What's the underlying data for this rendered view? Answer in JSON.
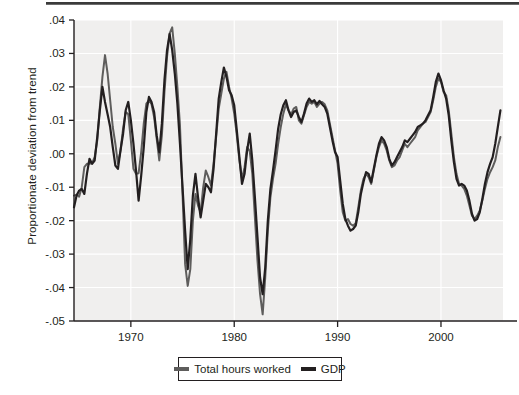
{
  "figure": {
    "background_color": "#ffffff",
    "plot_background_color": "#f0efee",
    "gridline_color": "#ffffff",
    "axis_color": "#231f20"
  },
  "axis_label": {
    "y": "Proportionate deviation from trend",
    "x": ""
  },
  "legend": {
    "position": "below-axis-center",
    "entries": [
      {
        "label": "Total hours worked",
        "color": "#5e5d5c"
      },
      {
        "label": "GDP",
        "color": "#231f20"
      }
    ]
  },
  "chart_data": {
    "type": "line",
    "title": "",
    "subtitle": "",
    "xlabel": "",
    "ylabel": "Proportionate deviation from trend",
    "xlim": [
      1964.5,
      2006.0
    ],
    "ylim": [
      -0.05,
      0.04
    ],
    "xticks": [
      1970,
      1980,
      1990,
      2000
    ],
    "xticklabels": [
      "1970",
      "1980",
      "1990",
      "2000"
    ],
    "yticks": [
      -0.05,
      -0.04,
      -0.03,
      -0.02,
      -0.01,
      0.0,
      0.01,
      0.02,
      0.03,
      0.04
    ],
    "yticklabels": [
      "-.05",
      "-.04",
      "-.03",
      "-.02",
      "-.01",
      ".00",
      ".01",
      ".02",
      ".03",
      ".04"
    ],
    "grid": true,
    "grid_axis": "both",
    "legend_position": "below",
    "x": [
      1964.5,
      1964.75,
      1965.0,
      1965.25,
      1965.5,
      1965.75,
      1966.0,
      1966.25,
      1966.5,
      1966.75,
      1967.0,
      1967.25,
      1967.5,
      1967.75,
      1968.0,
      1968.25,
      1968.5,
      1968.75,
      1969.0,
      1969.25,
      1969.5,
      1969.75,
      1970.0,
      1970.25,
      1970.5,
      1970.75,
      1971.0,
      1971.25,
      1971.5,
      1971.75,
      1972.0,
      1972.25,
      1972.5,
      1972.75,
      1973.0,
      1973.25,
      1973.5,
      1973.75,
      1974.0,
      1974.25,
      1974.5,
      1974.75,
      1975.0,
      1975.25,
      1975.5,
      1975.75,
      1976.0,
      1976.25,
      1976.5,
      1976.75,
      1977.0,
      1977.25,
      1977.5,
      1977.75,
      1978.0,
      1978.25,
      1978.5,
      1978.75,
      1979.0,
      1979.25,
      1979.5,
      1979.75,
      1980.0,
      1980.25,
      1980.5,
      1980.75,
      1981.0,
      1981.25,
      1981.5,
      1981.75,
      1982.0,
      1982.25,
      1982.5,
      1982.75,
      1983.0,
      1983.25,
      1983.5,
      1983.75,
      1984.0,
      1984.25,
      1984.5,
      1984.75,
      1985.0,
      1985.25,
      1985.5,
      1985.75,
      1986.0,
      1986.25,
      1986.5,
      1986.75,
      1987.0,
      1987.25,
      1987.5,
      1987.75,
      1988.0,
      1988.25,
      1988.5,
      1988.75,
      1989.0,
      1989.25,
      1989.5,
      1989.75,
      1990.0,
      1990.25,
      1990.5,
      1990.75,
      1991.0,
      1991.25,
      1991.5,
      1991.75,
      1992.0,
      1992.25,
      1992.5,
      1992.75,
      1993.0,
      1993.25,
      1993.5,
      1993.75,
      1994.0,
      1994.25,
      1994.5,
      1994.75,
      1995.0,
      1995.25,
      1995.5,
      1995.75,
      1996.0,
      1996.25,
      1996.5,
      1996.75,
      1997.0,
      1997.25,
      1997.5,
      1997.75,
      1998.0,
      1998.25,
      1998.5,
      1998.75,
      1999.0,
      1999.25,
      1999.5,
      1999.75,
      2000.0,
      2000.25,
      2000.5,
      2000.75,
      2001.0,
      2001.25,
      2001.5,
      2001.75,
      2002.0,
      2002.25,
      2002.5,
      2002.75,
      2003.0,
      2003.25,
      2003.5,
      2003.75,
      2004.0,
      2004.25,
      2004.5,
      2004.75,
      2005.0,
      2005.25,
      2005.5,
      2005.75
    ],
    "series": [
      {
        "name": "Total hours worked",
        "color": "#5e5d5c",
        "linewidth": 2.0,
        "values": [
          -0.0125,
          -0.0122,
          -0.0128,
          -0.01,
          -0.004,
          -0.003,
          -0.003,
          -0.0028,
          -0.001,
          0.004,
          0.014,
          0.023,
          0.0295,
          0.024,
          0.016,
          0.008,
          0.003,
          -0.003,
          0.001,
          0.0075,
          0.0125,
          0.0118,
          0.004,
          -0.0045,
          -0.006,
          -0.0058,
          0.0005,
          0.009,
          0.015,
          0.016,
          0.0148,
          0.011,
          0.0045,
          -0.002,
          0.0055,
          0.0185,
          0.029,
          0.036,
          0.0378,
          0.03,
          0.02,
          0.0085,
          -0.012,
          -0.033,
          -0.0395,
          -0.0345,
          -0.02,
          -0.012,
          -0.0155,
          -0.0175,
          -0.01,
          -0.005,
          -0.007,
          -0.0095,
          -0.003,
          0.005,
          0.0135,
          0.018,
          0.0225,
          0.0245,
          0.02,
          0.0165,
          0.012,
          0.0055,
          -0.002,
          -0.0075,
          -0.004,
          0.002,
          0.0008,
          -0.006,
          -0.019,
          -0.032,
          -0.042,
          -0.048,
          -0.037,
          -0.023,
          -0.013,
          -0.0075,
          -0.003,
          0.003,
          0.008,
          0.012,
          0.0148,
          0.013,
          0.0118,
          0.0135,
          0.014,
          0.01,
          0.009,
          0.0115,
          0.014,
          0.0155,
          0.015,
          0.0155,
          0.014,
          0.015,
          0.0155,
          0.0148,
          0.013,
          0.009,
          0.005,
          0.001,
          -0.003,
          -0.011,
          -0.0175,
          -0.02,
          -0.0195,
          -0.021,
          -0.0215,
          -0.0208,
          -0.016,
          -0.011,
          -0.0075,
          -0.006,
          -0.007,
          -0.009,
          -0.005,
          -0.001,
          0.002,
          0.004,
          0.003,
          0.001,
          -0.002,
          -0.004,
          -0.0035,
          -0.002,
          -0.001,
          0.001,
          0.003,
          0.002,
          0.003,
          0.004,
          0.005,
          0.007,
          0.008,
          0.009,
          0.0095,
          0.011,
          0.0125,
          0.016,
          0.02,
          0.0225,
          0.0215,
          0.0185,
          0.0175,
          0.013,
          0.006,
          -0.001,
          -0.006,
          -0.009,
          -0.0095,
          -0.0105,
          -0.0125,
          -0.0155,
          -0.0185,
          -0.0195,
          -0.0185,
          -0.017,
          -0.014,
          -0.0105,
          -0.0075,
          -0.0055,
          -0.004,
          -0.002,
          0.002,
          0.005
        ]
      },
      {
        "name": "GDP",
        "color": "#231f20",
        "linewidth": 2.2,
        "values": [
          -0.016,
          -0.0125,
          -0.011,
          -0.0105,
          -0.012,
          -0.006,
          -0.0015,
          -0.003,
          -0.002,
          0.005,
          0.013,
          0.02,
          0.0155,
          0.0118,
          0.008,
          0.002,
          -0.0035,
          -0.0045,
          0.001,
          0.006,
          0.013,
          0.0155,
          0.01,
          0.003,
          -0.005,
          -0.014,
          -0.0065,
          0.002,
          0.0125,
          0.017,
          0.0155,
          0.0125,
          0.0055,
          0.0005,
          0.009,
          0.022,
          0.031,
          0.0358,
          0.031,
          0.024,
          0.015,
          0.003,
          -0.01,
          -0.023,
          -0.0345,
          -0.0255,
          -0.0125,
          -0.006,
          -0.013,
          -0.019,
          -0.014,
          -0.009,
          -0.01,
          -0.0115,
          -0.0045,
          0.006,
          0.0165,
          0.0215,
          0.0258,
          0.023,
          0.019,
          0.0175,
          0.0145,
          0.007,
          -0.001,
          -0.009,
          -0.006,
          0.001,
          0.006,
          -0.002,
          -0.013,
          -0.025,
          -0.037,
          -0.042,
          -0.034,
          -0.02,
          -0.0105,
          -0.005,
          0.001,
          0.0075,
          0.0118,
          0.0145,
          0.016,
          0.013,
          0.011,
          0.0125,
          0.013,
          0.011,
          0.0095,
          0.012,
          0.015,
          0.0165,
          0.0155,
          0.016,
          0.0148,
          0.0158,
          0.0148,
          0.014,
          0.012,
          0.008,
          0.004,
          0.0005,
          -0.001,
          -0.008,
          -0.015,
          -0.0195,
          -0.0215,
          -0.023,
          -0.0225,
          -0.0215,
          -0.0175,
          -0.012,
          -0.0085,
          -0.0055,
          -0.006,
          -0.0085,
          -0.0045,
          -0.0005,
          0.003,
          0.005,
          0.004,
          0.002,
          -0.0015,
          -0.0035,
          -0.0025,
          -0.001,
          0.0005,
          0.002,
          0.004,
          0.0035,
          0.0045,
          0.0055,
          0.0065,
          0.008,
          0.0085,
          0.009,
          0.01,
          0.0115,
          0.013,
          0.017,
          0.0215,
          0.024,
          0.022,
          0.019,
          0.0165,
          0.0115,
          0.004,
          -0.0025,
          -0.0075,
          -0.0095,
          -0.009,
          -0.0095,
          -0.011,
          -0.014,
          -0.018,
          -0.02,
          -0.0195,
          -0.0175,
          -0.0135,
          -0.009,
          -0.0055,
          -0.003,
          -0.001,
          0.003,
          0.008,
          0.013
        ]
      }
    ]
  }
}
